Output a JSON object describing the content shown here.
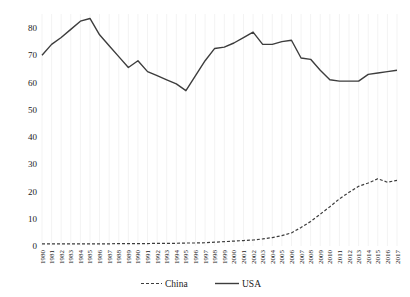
{
  "chart_data": {
    "type": "line",
    "x": [
      1980,
      1981,
      1982,
      1983,
      1984,
      1985,
      1986,
      1987,
      1988,
      1989,
      1990,
      1991,
      1992,
      1993,
      1994,
      1995,
      1996,
      1997,
      1998,
      1999,
      2000,
      2001,
      2002,
      2003,
      2004,
      2005,
      2006,
      2007,
      2008,
      2009,
      2010,
      2011,
      2012,
      2013,
      2014,
      2015,
      2016,
      2017
    ],
    "series": [
      {
        "name": "China",
        "style": "dashed",
        "values": [
          0.8,
          0.8,
          0.8,
          0.8,
          0.8,
          0.8,
          0.8,
          0.8,
          0.9,
          0.9,
          0.9,
          0.9,
          1.0,
          1.0,
          1.0,
          1.1,
          1.1,
          1.2,
          1.4,
          1.6,
          1.8,
          2.0,
          2.2,
          2.6,
          3.1,
          3.8,
          4.8,
          6.8,
          9.0,
          11.7,
          14.4,
          17.3,
          19.7,
          21.9,
          23.1,
          24.7,
          23.4,
          24.1
        ]
      },
      {
        "name": "USA",
        "style": "solid",
        "values": [
          70,
          74,
          76.5,
          79.5,
          82.5,
          83.5,
          77.5,
          73.5,
          69.5,
          65.5,
          68,
          64,
          62.5,
          61,
          59.5,
          57,
          62.5,
          68,
          72.5,
          73,
          74.5,
          76.5,
          78.5,
          74,
          74,
          75,
          75.5,
          69,
          68.5,
          64.5,
          61,
          60.5,
          60.5,
          60.5,
          63,
          63.5,
          64,
          64.5
        ]
      }
    ],
    "title": "",
    "xlabel": "",
    "ylabel": "",
    "ylim": [
      0,
      85
    ],
    "yticks": [
      0,
      10,
      20,
      30,
      40,
      50,
      60,
      70,
      80
    ],
    "grid": "faint vertical gridline per year, no horizontal gridlines",
    "legend_position": "bottom-center",
    "line_color": "#3d3d3d",
    "grid_color": "#f3f3f3",
    "label_color": "#1a1a1a"
  },
  "legend": {
    "items": [
      {
        "label": "China",
        "marker": "dashed-line"
      },
      {
        "label": "USA",
        "marker": "solid-line"
      }
    ]
  }
}
